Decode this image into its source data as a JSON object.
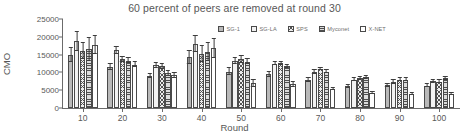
{
  "chart_data": {
    "type": "bar",
    "title": "60 percent of peers are removed at round 30",
    "xlabel": "Round",
    "ylabel": "CMO",
    "categories": [
      "10",
      "20",
      "30",
      "40",
      "50",
      "60",
      "70",
      "80",
      "90",
      "100"
    ],
    "ylim": [
      0,
      25000
    ],
    "yticks": [
      "0",
      "5000",
      "10000",
      "15000",
      "20000",
      "25000"
    ],
    "grid": false,
    "legend_position": "top-right",
    "error_bars": true,
    "series": [
      {
        "name": "SG-1",
        "values": [
          15000,
          11500,
          9000,
          14200,
          10200,
          9500,
          8000,
          6200,
          6400,
          6300
        ],
        "errors": [
          1900,
          900,
          600,
          1900,
          1000,
          600,
          500,
          400,
          400,
          400
        ],
        "pattern": "solid-gray"
      },
      {
        "name": "SG-LA",
        "values": [
          18800,
          16200,
          12000,
          18000,
          13200,
          12500,
          10200,
          8000,
          7400,
          7600
        ],
        "errors": [
          2600,
          900,
          700,
          2300,
          900,
          400,
          500,
          400,
          600,
          400
        ],
        "pattern": "light-solid"
      },
      {
        "name": "SPS",
        "values": [
          16000,
          13700,
          11700,
          15300,
          13700,
          12600,
          11000,
          8300,
          8000,
          7400
        ],
        "errors": [
          2200,
          700,
          800,
          2300,
          900,
          400,
          400,
          400,
          400,
          400
        ],
        "pattern": "crosshatch"
      },
      {
        "name": "Myconet",
        "values": [
          16500,
          13300,
          9700,
          15800,
          13000,
          11700,
          10200,
          8600,
          8000,
          8400
        ],
        "errors": [
          3200,
          700,
          700,
          2400,
          700,
          400,
          400,
          400,
          400,
          400
        ],
        "pattern": "horizontal-lines"
      },
      {
        "name": "X-NET",
        "values": [
          17800,
          12200,
          9200,
          16800,
          7000,
          6700,
          5300,
          4300,
          4000,
          3900
        ],
        "errors": [
          2500,
          700,
          600,
          2700,
          900,
          600,
          300,
          300,
          300,
          300
        ],
        "pattern": "white-outline"
      }
    ]
  }
}
